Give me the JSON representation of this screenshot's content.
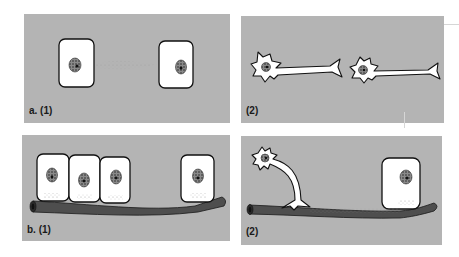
{
  "figure": {
    "panels": [
      {
        "id": "a1",
        "label": "a. (1)",
        "description": "Two isolated epithelial cells with diffuse signal between them"
      },
      {
        "id": "a2",
        "label": "(2)",
        "description": "Two isolated neurons with axons"
      },
      {
        "id": "b1",
        "label": "b. (1)",
        "description": "Epithelial cells resting on a blood vessel"
      },
      {
        "id": "b2",
        "label": "(2)",
        "description": "Neuron axon terminal and epithelial cell resting on a blood vessel"
      }
    ],
    "colors": {
      "panel_background": "#b4b4b4",
      "cell_fill": "#ffffff",
      "outline": "#111111",
      "vessel": "#4e4e4e",
      "nucleus": "#6a6a6a"
    }
  }
}
